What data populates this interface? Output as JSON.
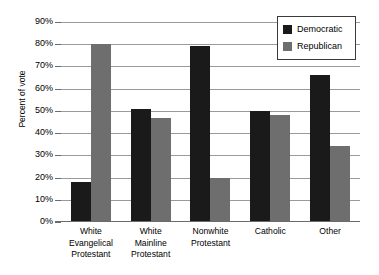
{
  "chart_data": {
    "type": "bar",
    "title": "",
    "xlabel": "",
    "ylabel": "Percent of vote",
    "ylim": [
      0,
      90
    ],
    "ytick_step": 10,
    "grid": true,
    "legend_position": "top-right",
    "categories": [
      "White Evangelical Protestant",
      "White Mainline Protestant",
      "Nonwhite Protestant",
      "Catholic",
      "Other"
    ],
    "category_lines": [
      [
        "White",
        "Evangelical",
        "Protestant"
      ],
      [
        "White",
        "Mainline",
        "Protestant"
      ],
      [
        "Nonwhite",
        "Protestant"
      ],
      [
        "Catholic"
      ],
      [
        "Other"
      ]
    ],
    "ytick_labels": [
      "90%",
      "80%",
      "70%",
      "60%",
      "50%",
      "40%",
      "30%",
      "20%",
      "10%",
      "0%"
    ],
    "ytick_values": [
      90,
      80,
      70,
      60,
      50,
      40,
      30,
      20,
      10,
      0
    ],
    "series": [
      {
        "name": "Democratic",
        "color": "#1a1a1a",
        "values": [
          18,
          51,
          79,
          50,
          66
        ]
      },
      {
        "name": "Republican",
        "color": "#6e6e6e",
        "values": [
          80,
          47,
          20,
          48,
          34
        ]
      }
    ]
  },
  "legend": {
    "items": [
      {
        "label": "Democratic",
        "color": "#1a1a1a"
      },
      {
        "label": "Republican",
        "color": "#6e6e6e"
      }
    ]
  },
  "colors": {
    "democratic": "#1a1a1a",
    "republican": "#6e6e6e",
    "gridline": "#9a9a9a",
    "axis": "#6b6b6b",
    "background": "#ffffff"
  }
}
